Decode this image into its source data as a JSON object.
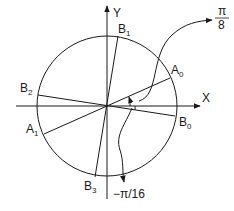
{
  "diagram": {
    "axes": {
      "x_label": "X",
      "y_label": "Y"
    },
    "points": {
      "A0": {
        "label": "A",
        "sub": "0"
      },
      "A1": {
        "label": "A",
        "sub": "1"
      },
      "B0": {
        "label": "B",
        "sub": "0"
      },
      "B1": {
        "label": "B",
        "sub": "1"
      },
      "B2": {
        "label": "B",
        "sub": "2"
      },
      "B3": {
        "label": "B",
        "sub": "3"
      }
    },
    "angles": {
      "positive": {
        "numerator": "π",
        "denominator": "8"
      },
      "negative": {
        "text": "−π/16"
      }
    },
    "colors": {
      "stroke": "#1a1a1a",
      "background": "#ffffff"
    }
  }
}
